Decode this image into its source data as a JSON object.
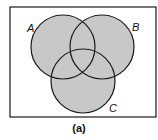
{
  "diagram": {
    "type": "venn",
    "shaded_region": "A ∪ B ∪ C",
    "universe_box": {
      "x": 10,
      "y": 7,
      "width": 146,
      "height": 110
    },
    "sets": [
      {
        "label": "A",
        "cx": 63,
        "cy": 47,
        "r": 32,
        "label_x": 27,
        "label_y": 32
      },
      {
        "label": "B",
        "cx": 102,
        "cy": 47,
        "r": 32,
        "label_x": 132,
        "label_y": 31
      },
      {
        "label": "C",
        "cx": 83,
        "cy": 81,
        "r": 32,
        "label_x": 109,
        "label_y": 112
      }
    ],
    "fill_color": "#c8c8c8",
    "stroke_color": "#1a1a1a",
    "caption": "(a)"
  }
}
